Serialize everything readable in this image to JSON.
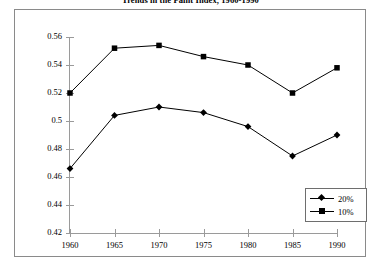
{
  "chart_data": {
    "type": "line",
    "title": "Trends in the Paint Index, 1960-1990",
    "xlabel": "",
    "ylabel": "",
    "categories": [
      "1960",
      "1965",
      "1970",
      "1975",
      "1980",
      "1985",
      "1990"
    ],
    "x": [
      1960,
      1965,
      1970,
      1975,
      1980,
      1985,
      1990
    ],
    "series": [
      {
        "name": "20%",
        "marker": "diamond",
        "color": "#000000",
        "values": [
          0.466,
          0.504,
          0.51,
          0.506,
          0.496,
          0.475,
          0.49
        ]
      },
      {
        "name": "10%",
        "marker": "square",
        "color": "#000000",
        "values": [
          0.52,
          0.552,
          0.554,
          0.546,
          0.54,
          0.52,
          0.538
        ]
      }
    ],
    "ylim": [
      0.42,
      0.56
    ],
    "ytick_values": [
      0.42,
      0.44,
      0.46,
      0.48,
      0.5,
      0.52,
      0.54,
      0.56
    ],
    "ytick_labels": [
      "0.42",
      "0.44",
      "0.46",
      "0.48",
      "0.5",
      "0.52",
      "0.54",
      "0.56"
    ],
    "xlim": [
      1960,
      1990
    ],
    "grid": false,
    "legend_position": "bottom-right"
  },
  "legend": {
    "entries": [
      {
        "label": "20%",
        "marker": "diamond"
      },
      {
        "label": "10%",
        "marker": "square"
      }
    ]
  },
  "colors": {
    "series_line": "#000000",
    "axis": "#9a9a9a",
    "frame": "#8a8a8a",
    "background": "#ffffff"
  }
}
